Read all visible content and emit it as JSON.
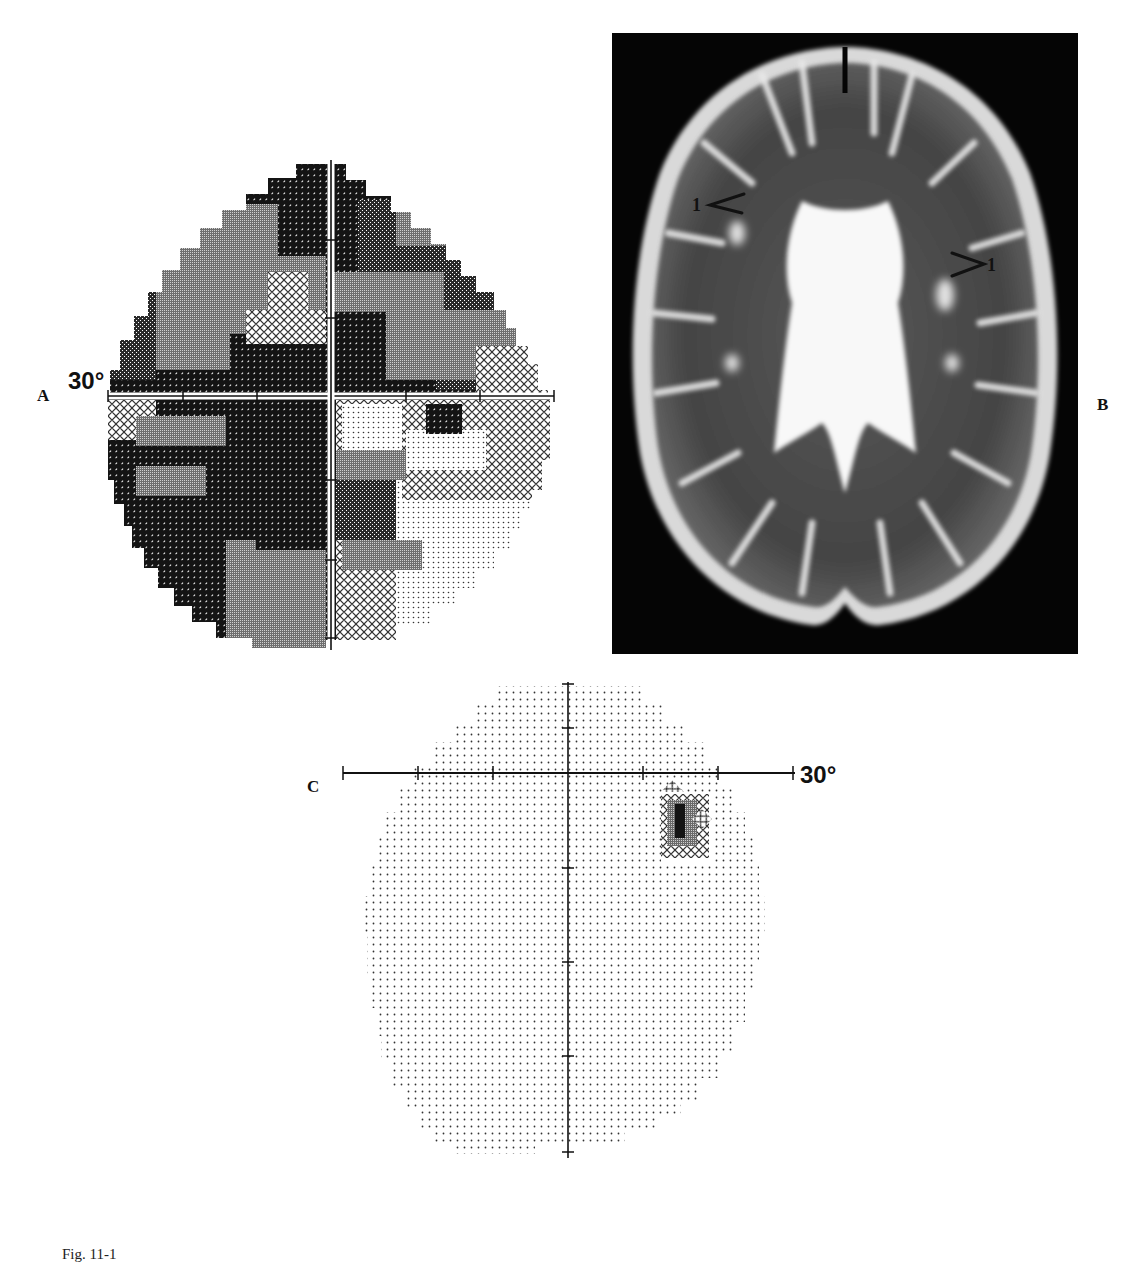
{
  "figure": {
    "panels": [
      {
        "id": "A",
        "label": "A",
        "type": "visual-field-grayscale",
        "eccentricity_label": "30°",
        "description": "Dense grayscale visual-field plot showing diffuse, severe field loss with darkest tones throughout; lighter (less affected) areas in the inferior-right quadrant"
      },
      {
        "id": "B",
        "label": "B",
        "type": "axial-T2-MRI",
        "annotations": [
          {
            "text": "1",
            "side": "left",
            "pointer": "arrowhead"
          },
          {
            "text": "1",
            "side": "right",
            "pointer": "arrowhead"
          }
        ],
        "description": "Axial T2-weighted brain MRI with periventricular white-matter hyperintensities marked by arrowheads labeled 1"
      },
      {
        "id": "C",
        "label": "C",
        "type": "visual-field-grayscale",
        "eccentricity_label": "30°",
        "description": "Near-normal visual field (light dots) with a small dense scotoma just below the horizontal meridian on the right, near the blind spot"
      }
    ],
    "caption": "Fig. 11-1"
  },
  "colors": {
    "background": "#ffffff",
    "ink": "#111111",
    "mri_background": "#050505",
    "tone_black": "#141414",
    "tone_dark": "#3c3c3c",
    "tone_mid": "#7a7a7a",
    "tone_light": "#b9b9b9",
    "tone_dots": "#e6e6e6"
  }
}
